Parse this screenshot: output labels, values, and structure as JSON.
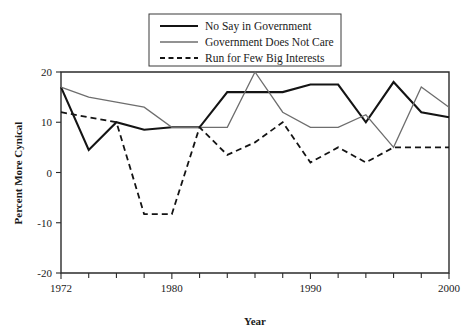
{
  "chart_data": {
    "type": "line",
    "title": "",
    "xlabel": "Year",
    "ylabel": "Percent More Cynical",
    "xlim": [
      1972,
      2000
    ],
    "ylim": [
      -20,
      20
    ],
    "grid": false,
    "legend_position": "top-center",
    "x": [
      1972,
      1974,
      1976,
      1978,
      1980,
      1982,
      1984,
      1986,
      1988,
      1990,
      1992,
      1994,
      1996,
      1998,
      2000
    ],
    "x_tick_labels": [
      "1972",
      "1980",
      "1990",
      "2000"
    ],
    "x_tick_values": [
      1972,
      1980,
      1990,
      2000
    ],
    "x_minor_ticks": [
      1974,
      1976,
      1978,
      1982,
      1984,
      1986,
      1988,
      1992,
      1994,
      1996,
      1998
    ],
    "y_tick_labels": [
      "20",
      "10",
      "0",
      "-10",
      "-20"
    ],
    "y_tick_values": [
      20,
      10,
      0,
      -10,
      -20
    ],
    "series": [
      {
        "name": "No Say in Government",
        "style": "solid",
        "color": "#141414",
        "width": 2.1,
        "values": [
          17,
          4.5,
          10,
          8.5,
          9,
          9,
          16,
          16,
          16,
          17.5,
          17.5,
          10,
          18,
          12,
          11
        ]
      },
      {
        "name": "Government Does Not Care",
        "style": "solid",
        "color": "#6e6e6e",
        "width": 1.3,
        "values": [
          17,
          15,
          14,
          13,
          9,
          9,
          9,
          20,
          12,
          9,
          9,
          11.5,
          5,
          17,
          13
        ]
      },
      {
        "name": "Run for Few Big Interests",
        "style": "dashed",
        "color": "#141414",
        "width": 1.8,
        "values": [
          12,
          11,
          10,
          -8.3,
          -8.3,
          9,
          3.5,
          6,
          10,
          2,
          5,
          2,
          5,
          5,
          5
        ]
      }
    ]
  },
  "legend": {
    "entries": [
      {
        "label": "No Say in Government"
      },
      {
        "label": "Government Does Not Care"
      },
      {
        "label": "Run for Few Big Interests"
      }
    ]
  }
}
